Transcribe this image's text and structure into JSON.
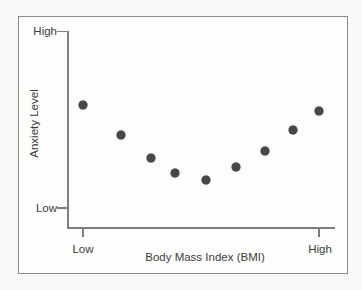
{
  "chart_data": {
    "type": "scatter",
    "xlabel": "Body Mass Index (BMI)",
    "ylabel": "Anxiety Level",
    "x_tick_labels": [
      "Low",
      "High"
    ],
    "y_tick_labels": [
      "Low",
      "High"
    ],
    "xlim": [
      0,
      1
    ],
    "ylim": [
      0,
      1
    ],
    "grid": false,
    "legend": false,
    "points": [
      {
        "x": 0.0,
        "y": 0.58
      },
      {
        "x": 0.16,
        "y": 0.41
      },
      {
        "x": 0.29,
        "y": 0.28
      },
      {
        "x": 0.39,
        "y": 0.2
      },
      {
        "x": 0.52,
        "y": 0.16
      },
      {
        "x": 0.65,
        "y": 0.23
      },
      {
        "x": 0.77,
        "y": 0.32
      },
      {
        "x": 0.89,
        "y": 0.44
      },
      {
        "x": 1.0,
        "y": 0.55
      }
    ],
    "point_color": "#474747",
    "axis_color": "#7f7f7f",
    "frame_color": "#8a8a8a",
    "text_color": "#3c3c3c"
  }
}
